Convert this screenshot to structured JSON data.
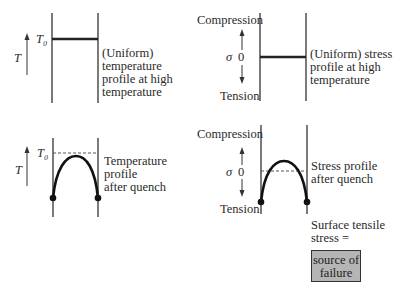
{
  "panels": {
    "top_left": {
      "axis_label": "T",
      "level_label": "T₀",
      "caption": [
        "(Uniform)",
        "temperature",
        "profile at high",
        "temperature"
      ]
    },
    "top_right": {
      "top_label": "Compression",
      "axis_label": "σ",
      "zero_label": "0",
      "bottom_label": "Tension",
      "caption": [
        "(Uniform) stress",
        "profile at high",
        "temperature"
      ]
    },
    "bottom_left": {
      "axis_label": "T",
      "level_label": "T₀",
      "caption": [
        "Temperature",
        "profile",
        "after quench"
      ]
    },
    "bottom_right": {
      "top_label": "Compression",
      "axis_label": "σ",
      "zero_label": "0",
      "bottom_label": "Tension",
      "caption": [
        "Stress profile",
        "after quench"
      ],
      "note": [
        "Surface tensile",
        "stress ="
      ],
      "box": [
        "source of",
        "failure"
      ]
    }
  },
  "colors": {
    "line": "#222222",
    "box_fill": "#b5b5b5"
  }
}
